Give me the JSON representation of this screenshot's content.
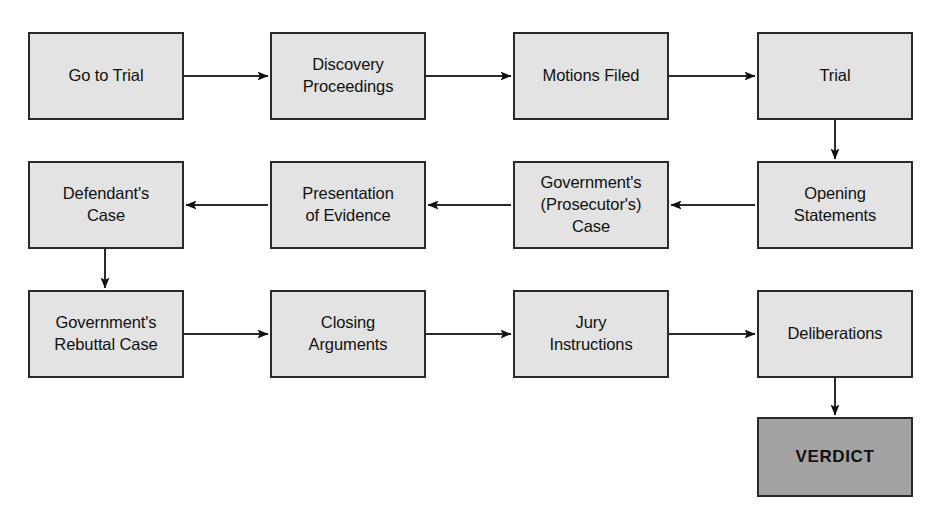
{
  "diagram": {
    "background_color": "#ffffff",
    "node_fill": "#e3e3e3",
    "terminal_fill": "#a3a3a3",
    "stroke_color": "#2a2a2a",
    "text_color": "#111111"
  },
  "nodes": [
    {
      "id": "go-to-trial",
      "label": "Go to Trial",
      "x": 28,
      "y": 32,
      "w": 156,
      "h": 88,
      "terminal": false
    },
    {
      "id": "discovery",
      "label": "Discovery\nProceedings",
      "x": 270,
      "y": 32,
      "w": 156,
      "h": 88,
      "terminal": false
    },
    {
      "id": "motions-filed",
      "label": "Motions Filed",
      "x": 513,
      "y": 32,
      "w": 156,
      "h": 88,
      "terminal": false
    },
    {
      "id": "trial",
      "label": "Trial",
      "x": 757,
      "y": 32,
      "w": 156,
      "h": 88,
      "terminal": false
    },
    {
      "id": "defendants-case",
      "label": "Defendant's\nCase",
      "x": 28,
      "y": 161,
      "w": 156,
      "h": 88,
      "terminal": false
    },
    {
      "id": "presentation",
      "label": "Presentation\nof Evidence",
      "x": 270,
      "y": 161,
      "w": 156,
      "h": 88,
      "terminal": false
    },
    {
      "id": "governments-case",
      "label": "Government's\n(Prosecutor's)\nCase",
      "x": 513,
      "y": 161,
      "w": 156,
      "h": 88,
      "terminal": false
    },
    {
      "id": "opening-statements",
      "label": "Opening\nStatements",
      "x": 757,
      "y": 161,
      "w": 156,
      "h": 88,
      "terminal": false
    },
    {
      "id": "rebuttal-case",
      "label": "Government's\nRebuttal Case",
      "x": 28,
      "y": 290,
      "w": 156,
      "h": 88,
      "terminal": false
    },
    {
      "id": "closing-arguments",
      "label": "Closing\nArguments",
      "x": 270,
      "y": 290,
      "w": 156,
      "h": 88,
      "terminal": false
    },
    {
      "id": "jury-instructions",
      "label": "Jury\nInstructions",
      "x": 513,
      "y": 290,
      "w": 156,
      "h": 88,
      "terminal": false
    },
    {
      "id": "deliberations",
      "label": "Deliberations",
      "x": 757,
      "y": 290,
      "w": 156,
      "h": 88,
      "terminal": false
    },
    {
      "id": "verdict",
      "label": "VERDICT",
      "x": 757,
      "y": 417,
      "w": 156,
      "h": 80,
      "terminal": true
    }
  ],
  "edges": [
    {
      "id": "e1",
      "from": "go-to-trial",
      "to": "discovery",
      "orientation": "horizontal-right",
      "x1": 184,
      "y1": 76,
      "x2": 268,
      "y2": 76
    },
    {
      "id": "e2",
      "from": "discovery",
      "to": "motions-filed",
      "orientation": "horizontal-right",
      "x1": 426,
      "y1": 76,
      "x2": 511,
      "y2": 76
    },
    {
      "id": "e3",
      "from": "motions-filed",
      "to": "trial",
      "orientation": "horizontal-right",
      "x1": 669,
      "y1": 76,
      "x2": 755,
      "y2": 76
    },
    {
      "id": "e4",
      "from": "trial",
      "to": "opening-statements",
      "orientation": "vertical-down",
      "x1": 835,
      "y1": 120,
      "x2": 835,
      "y2": 159
    },
    {
      "id": "e5",
      "from": "opening-statements",
      "to": "governments-case",
      "orientation": "horizontal-left",
      "x1": 755,
      "y1": 205,
      "x2": 671,
      "y2": 205
    },
    {
      "id": "e6",
      "from": "governments-case",
      "to": "presentation",
      "orientation": "horizontal-left",
      "x1": 511,
      "y1": 205,
      "x2": 428,
      "y2": 205
    },
    {
      "id": "e7",
      "from": "presentation",
      "to": "defendants-case",
      "orientation": "horizontal-left",
      "x1": 268,
      "y1": 205,
      "x2": 186,
      "y2": 205
    },
    {
      "id": "e8",
      "from": "defendants-case",
      "to": "rebuttal-case",
      "orientation": "vertical-down",
      "x1": 105,
      "y1": 249,
      "x2": 105,
      "y2": 288
    },
    {
      "id": "e9",
      "from": "rebuttal-case",
      "to": "closing-arguments",
      "orientation": "horizontal-right",
      "x1": 184,
      "y1": 334,
      "x2": 268,
      "y2": 334
    },
    {
      "id": "e10",
      "from": "closing-arguments",
      "to": "jury-instructions",
      "orientation": "horizontal-right",
      "x1": 426,
      "y1": 334,
      "x2": 511,
      "y2": 334
    },
    {
      "id": "e11",
      "from": "jury-instructions",
      "to": "deliberations",
      "orientation": "horizontal-right",
      "x1": 669,
      "y1": 334,
      "x2": 755,
      "y2": 334
    },
    {
      "id": "e12",
      "from": "deliberations",
      "to": "verdict",
      "orientation": "vertical-down",
      "x1": 835,
      "y1": 378,
      "x2": 835,
      "y2": 415
    }
  ]
}
